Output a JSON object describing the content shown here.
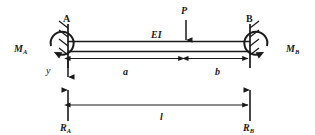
{
  "figure": {
    "type": "beam-diagram",
    "stroke_color": "#1a1a1a",
    "background_color": "#ffffff"
  },
  "supports": {
    "left": {
      "label": "A",
      "kind": "fixed-support",
      "hatch_side": "left"
    },
    "right": {
      "label": "B",
      "kind": "fixed-support",
      "hatch_side": "right"
    }
  },
  "beam": {
    "stiffness_label": "EI"
  },
  "loads": {
    "point_load": {
      "label": "P",
      "direction": "down"
    }
  },
  "moments": {
    "left": {
      "base": "M",
      "subscript": "A",
      "sense": "arc-open-right"
    },
    "right": {
      "base": "M",
      "subscript": "B",
      "sense": "arc-open-left"
    }
  },
  "reactions": {
    "left": {
      "base": "R",
      "subscript": "A",
      "direction": "up"
    },
    "right": {
      "base": "R",
      "subscript": "B",
      "direction": "up"
    }
  },
  "axes": {
    "vertical": {
      "label": "y",
      "direction": "down"
    }
  },
  "dimensions": {
    "a": {
      "label": "a",
      "span": "support-A-to-load-P"
    },
    "b": {
      "label": "b",
      "span": "load-P-to-support-B"
    },
    "l": {
      "label": "l",
      "span": "support-A-to-support-B"
    }
  }
}
